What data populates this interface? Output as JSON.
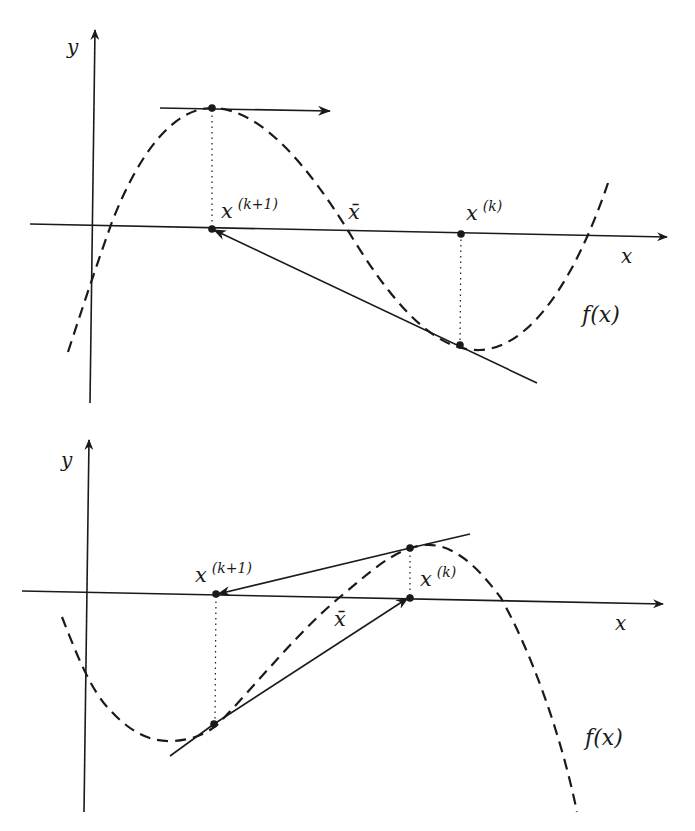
{
  "figures": [
    {
      "id": "top",
      "description": "Newton's method failure: iterate lands on a stationary point (horizontal tangent)",
      "axis_labels": {
        "x": "x",
        "y": "y"
      },
      "function_label": "f(x)",
      "points": {
        "x_k_plus_1": {
          "base": "x",
          "sup": "(k+1)"
        },
        "x_bar": "x̄",
        "x_k": {
          "base": "x",
          "sup": "(k)"
        }
      }
    },
    {
      "id": "bottom",
      "description": "Newton's method cycling between two iterates",
      "axis_labels": {
        "x": "x",
        "y": "y"
      },
      "function_label": "f(x)",
      "points": {
        "x_k_plus_1": {
          "base": "x",
          "sup": "(k+1)"
        },
        "x_bar": "x̄",
        "x_k": {
          "base": "x",
          "sup": "(k)"
        }
      }
    }
  ],
  "colors": {
    "ink": "#1a1a1a",
    "background": "#ffffff"
  }
}
